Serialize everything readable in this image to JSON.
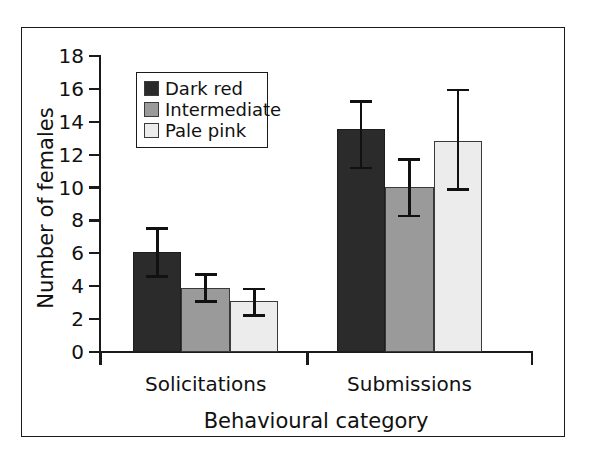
{
  "chart_data": {
    "type": "bar",
    "title": "",
    "subtitle": "",
    "xlabel": "Behavioural category",
    "ylabel": "Number of females",
    "categories": [
      "Solicitations",
      "Submissions"
    ],
    "ylim": [
      0,
      18
    ],
    "ytick_labels": [
      "0",
      "2",
      "4",
      "6",
      "8",
      "10",
      "12",
      "14",
      "16",
      "18"
    ],
    "ytick_values": [
      0,
      2,
      4,
      6,
      8,
      10,
      12,
      14,
      16,
      18
    ],
    "grid": false,
    "legend_position": "upper-left-inside",
    "error_bars": "asymmetric-whiskers",
    "series": [
      {
        "name": "Dark red",
        "color": "#2b2b2b",
        "values": [
          6.1,
          13.55
        ],
        "err_low": [
          4.5,
          11.1
        ],
        "err_high": [
          7.6,
          15.3
        ]
      },
      {
        "name": "Intermediate",
        "color": "#9a9a9a",
        "values": [
          3.9,
          10.05
        ],
        "err_low": [
          3.0,
          8.2
        ],
        "err_high": [
          4.8,
          11.8
        ]
      },
      {
        "name": "Pale pink",
        "color": "#ececec",
        "values": [
          3.1,
          12.85
        ],
        "err_low": [
          2.15,
          9.8
        ],
        "err_high": [
          3.9,
          16.0
        ]
      }
    ]
  },
  "legend": {
    "items": [
      {
        "label": "Dark red",
        "color": "#2b2b2b"
      },
      {
        "label": "Intermediate",
        "color": "#9a9a9a"
      },
      {
        "label": "Pale pink",
        "color": "#ececec"
      }
    ]
  },
  "axes": {
    "y_title": "Number of females",
    "x_title": "Behavioural category",
    "y_ticks": [
      "18",
      "16",
      "14",
      "12",
      "10",
      "8",
      "6",
      "4",
      "2",
      "0"
    ],
    "x_categories": [
      "Solicitations",
      "Submissions"
    ]
  },
  "colors": {
    "dark_red": "#2b2b2b",
    "intermediate": "#9a9a9a",
    "pale_pink": "#ececec",
    "ink": "#1a1a1a",
    "background": "#ffffff"
  }
}
